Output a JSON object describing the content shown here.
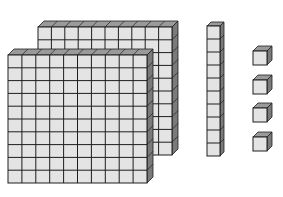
{
  "diagram": {
    "type": "base-ten-blocks",
    "colors": {
      "face": "#e4e4e4",
      "top": "#9a9a9a",
      "side": "#7a7a7a",
      "line": "#1e1e1e"
    },
    "blocks": [
      {
        "kind": "hundred-flat",
        "count": 2,
        "grid": [
          10,
          10
        ]
      },
      {
        "kind": "ten-rod",
        "count": 1,
        "cells": 10
      },
      {
        "kind": "unit-cube",
        "count": 4
      }
    ],
    "value_represented": 214
  }
}
